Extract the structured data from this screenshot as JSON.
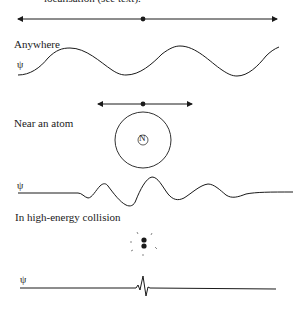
{
  "caption_fragment": "localisation (see text).",
  "panels": [
    {
      "label": "Anywhere",
      "psi": "ψ"
    },
    {
      "label": "Near an atom",
      "psi": "ψ",
      "nucleus": "N"
    },
    {
      "label": "In high-energy collision",
      "psi": "ψ"
    }
  ],
  "colors": {
    "ink": "#1a1a1a",
    "background": "#ffffff"
  }
}
